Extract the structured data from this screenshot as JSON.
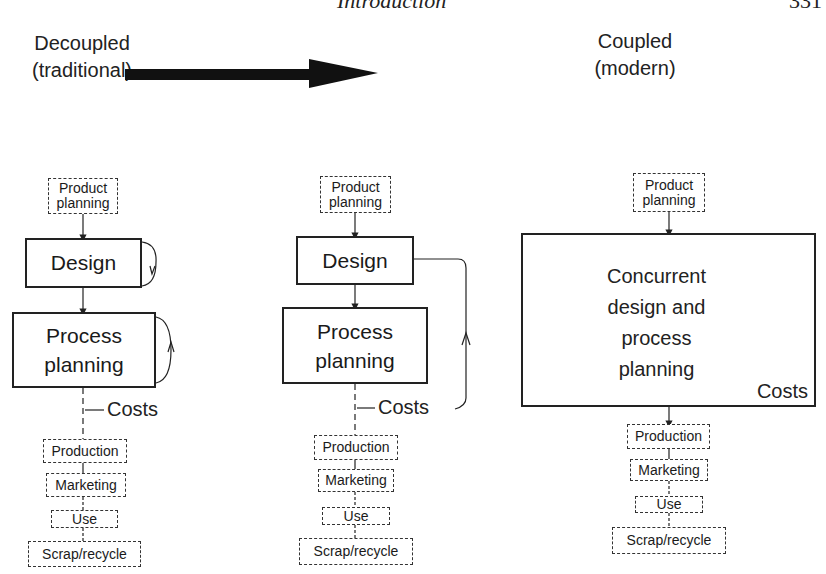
{
  "page_header": {
    "running_title": "Introduction",
    "page_number": "331"
  },
  "transition": {
    "from_label": [
      "Decoupled",
      "(traditional)"
    ],
    "to_label": [
      "Coupled",
      "(modern)"
    ],
    "arrow": "right-arrow"
  },
  "columns": [
    {
      "id": "decoupled",
      "stages": {
        "product_planning": [
          "Product",
          "planning"
        ],
        "design": "Design",
        "process_planning": [
          "Process",
          "planning"
        ],
        "costs": "Costs",
        "production": "Production",
        "marketing": "Marketing",
        "use": "Use",
        "scrap": "Scrap/recycle"
      },
      "feedback": "self-loops on Design and Process planning"
    },
    {
      "id": "intermediate",
      "stages": {
        "product_planning": [
          "Product",
          "planning"
        ],
        "design": "Design",
        "process_planning": [
          "Process",
          "planning"
        ],
        "costs": "Costs",
        "production": "Production",
        "marketing": "Marketing",
        "use": "Use",
        "scrap": "Scrap/recycle"
      },
      "feedback": "loop from Costs back to Design"
    },
    {
      "id": "coupled",
      "stages": {
        "product_planning": [
          "Product",
          "planning"
        ],
        "concurrent": [
          "Concurrent",
          "design and",
          "process",
          "planning"
        ],
        "costs": "Costs",
        "production": "Production",
        "marketing": "Marketing",
        "use": "Use",
        "scrap": "Scrap/recycle"
      },
      "feedback": "two circular arrows inside concurrent box"
    }
  ]
}
